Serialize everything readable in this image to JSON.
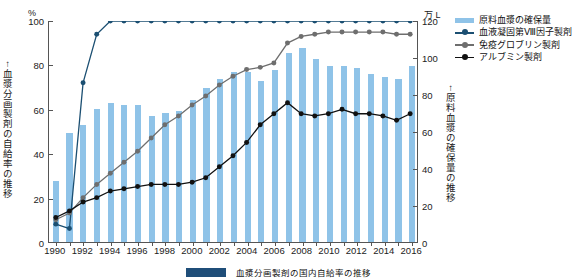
{
  "axes": {
    "left_unit": "%",
    "right_unit": "万 L",
    "left_caption": "↑血漿分画製剤の自給率の推移",
    "right_caption": "↑原料血漿の確保量の推移"
  },
  "legend": {
    "items": [
      {
        "label": "原料血漿の確保量",
        "marker": "bar",
        "color": "#8fc3e8"
      },
      {
        "label": "血液凝固第Ⅷ因子製剤",
        "marker": "line-dot",
        "color": "#1b4f72"
      },
      {
        "label": "免疫グロブリン製剤",
        "marker": "line-dot",
        "color": "#6e6e6e"
      },
      {
        "label": "アルブミン製剤",
        "marker": "line-dot",
        "color": "#111111"
      }
    ]
  },
  "caption": {
    "chip_color": "#1f4e79",
    "text": "血漿分画製剤の国内自給率の推移"
  },
  "chart_data": {
    "type": "bar",
    "title": "",
    "xlabel": "",
    "ylabel": "自給率",
    "grid": false,
    "legend_position": "top-right",
    "x": [
      1990,
      1991,
      1992,
      1993,
      1994,
      1995,
      1996,
      1997,
      1998,
      1999,
      2000,
      2001,
      2002,
      2003,
      2004,
      2005,
      2006,
      2007,
      2008,
      2009,
      2010,
      2011,
      2012,
      2013,
      2014,
      2015,
      2016
    ],
    "xtick_labels": [
      "1990",
      "1992",
      "1994",
      "1996",
      "1998",
      "2000",
      "2002",
      "2004",
      "2006",
      "2008",
      "2010",
      "2012",
      "2014",
      "2016"
    ],
    "ylim": [
      0,
      100
    ],
    "ytick_labels": [
      "0",
      "20",
      "40",
      "60",
      "80",
      "100"
    ],
    "ylim_right": [
      0,
      120
    ],
    "ytick_labels_right": [
      "0",
      "20",
      "40",
      "60",
      "80",
      "100",
      "120"
    ],
    "bars": {
      "name": "原料血漿の確保量",
      "unit": "万 L",
      "color": "#8fc3e8",
      "axis": "right",
      "values": [
        33,
        59,
        63,
        72,
        75,
        74,
        74,
        68,
        70,
        71,
        77,
        83,
        88,
        92,
        92,
        87,
        93,
        102,
        105,
        99,
        95,
        95,
        94,
        91,
        89,
        88,
        95
      ]
    },
    "series": [
      {
        "name": "血液凝固第Ⅷ因子製剤",
        "color": "#1b4f72",
        "axis": "left",
        "unit": "%",
        "values": [
          8,
          6,
          72,
          94,
          100,
          100,
          100,
          100,
          100,
          100,
          100,
          100,
          100,
          100,
          100,
          100,
          100,
          100,
          100,
          100,
          100,
          100,
          100,
          100,
          100,
          100,
          100
        ]
      },
      {
        "name": "免疫グロブリン製剤",
        "color": "#6e6e6e",
        "axis": "left",
        "unit": "%",
        "values": [
          10,
          13,
          20,
          26,
          31,
          36,
          41,
          47,
          53,
          57,
          62,
          66,
          71,
          75,
          78,
          79,
          81,
          90,
          93,
          94,
          95,
          95,
          95,
          95,
          95,
          94,
          94
        ]
      },
      {
        "name": "アルブミン製剤",
        "color": "#111111",
        "axis": "left",
        "unit": "%",
        "values": [
          11,
          14,
          18,
          20,
          23,
          24,
          25,
          26,
          26,
          26,
          27,
          29,
          34,
          39,
          45,
          53,
          58,
          63,
          58,
          57,
          58,
          60,
          58,
          58,
          57,
          55,
          58
        ]
      }
    ]
  }
}
